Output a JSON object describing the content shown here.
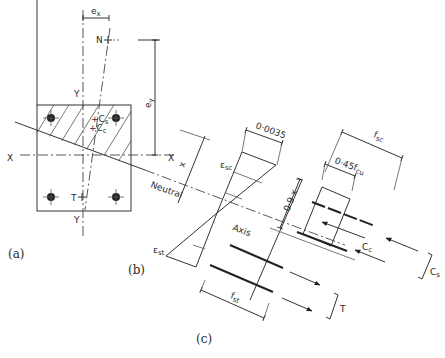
{
  "figure": {
    "panels": [
      {
        "id": "a",
        "caption": "(a)"
      },
      {
        "id": "b",
        "caption": "(b)"
      },
      {
        "id": "c",
        "caption": "(c)"
      }
    ],
    "section": {
      "labels": {
        "ex": "e",
        "ex_sub": "x",
        "ey": "e",
        "ey_sub": "y",
        "N": "N",
        "Y_top": "Y",
        "Y_bottom": "Y",
        "X_left": "X",
        "X_right": "X",
        "Cs": "+C",
        "Cs_sub": "s",
        "Cc": "+C",
        "Cc_sub": "c",
        "T": "T"
      }
    },
    "strain": {
      "labels": {
        "x": "x",
        "neutral": "Neutral",
        "axis": "Axis",
        "eps_sc": "ε",
        "eps_sc_sub": "sc",
        "eps_st": "ε",
        "eps_st_sub": "st",
        "strain_limit": "0·0035"
      }
    },
    "stress": {
      "labels": {
        "depth": "0·9 x",
        "fsc": "f",
        "fsc_sub": "sc",
        "fcu_block": "0·45f",
        "fcu_sub": "cu",
        "Cc": "C",
        "Cc_sub": "c",
        "Cs": "C",
        "Cs_sub": "s",
        "fst": "f",
        "fst_sub": "st",
        "T": "T"
      }
    }
  }
}
